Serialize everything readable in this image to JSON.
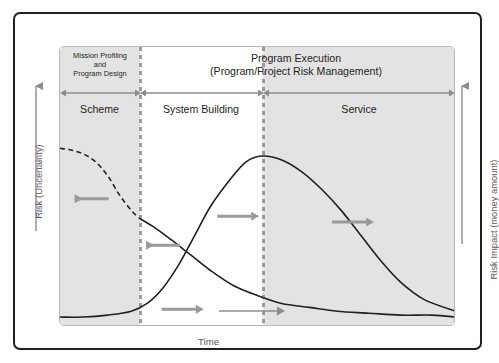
{
  "figure": {
    "title_left": "Mission Profiling\nand\nProgram Design",
    "title_right": "Program Execution\n(Program/Project Risk Management)",
    "axis_left_label": "Risk (Uncertainty)",
    "axis_right_label": "Risk Impact (money amount)",
    "axis_bottom_label": "Time",
    "phases": [
      {
        "label": "Scheme"
      },
      {
        "label": "System Building"
      },
      {
        "label": "Service"
      }
    ],
    "colors": {
      "frame": "#231f20",
      "plot_border": "#b9b9b9",
      "shade": "#e3e3e3",
      "divider": "#9a9a9a",
      "curve": "#231f20",
      "annotation_arrow": "#9a9a9a",
      "axis_arrow": "#8c8c8c",
      "text": "#231f20"
    }
  },
  "chart_data": {
    "type": "line",
    "title": "Program Execution",
    "subtitle": "(Program/Project Risk Management)",
    "xlabel": "Time",
    "ylabel": "Risk (Uncertainty)",
    "y2label": "Risk Impact (money amount)",
    "grid": false,
    "legend": null,
    "xlim": [
      0,
      100
    ],
    "ylim": [
      0,
      100
    ],
    "phase_boundaries": [
      20,
      51
    ],
    "phase_regions": [
      {
        "name": "Scheme",
        "x_start": 0,
        "x_end": 20,
        "shaded": true
      },
      {
        "name": "System Building",
        "x_start": 20,
        "x_end": 51,
        "shaded": false
      },
      {
        "name": "Service",
        "x_start": 51,
        "x_end": 100,
        "shaded": true
      }
    ],
    "series": [
      {
        "name": "Risk (Uncertainty)",
        "style": "dashed-then-solid",
        "dashed_until_x": 20,
        "x": [
          0,
          3,
          6,
          9,
          12,
          15,
          18,
          20,
          24,
          28,
          33,
          38,
          44,
          50,
          56,
          63,
          70,
          78,
          86,
          94,
          100
        ],
        "y": [
          88,
          87,
          85,
          81,
          74,
          64,
          56,
          52,
          47,
          41,
          33,
          25,
          17,
          12,
          8,
          6,
          4,
          3,
          2,
          2,
          1
        ]
      },
      {
        "name": "Risk Impact (money amount)",
        "style": "solid",
        "x": [
          0,
          6,
          12,
          18,
          22,
          26,
          30,
          34,
          38,
          43,
          47,
          51,
          56,
          61,
          66,
          71,
          76,
          81,
          86,
          92,
          100
        ],
        "y": [
          1,
          1,
          2,
          4,
          8,
          16,
          28,
          43,
          58,
          72,
          81,
          84,
          82,
          76,
          67,
          56,
          43,
          30,
          19,
          10,
          4
        ]
      }
    ],
    "annotations": [
      {
        "text": "",
        "icon": "left-arrow",
        "x": 8,
        "y": 62,
        "direction": "left",
        "refers_to": "Risk (Uncertainty)"
      },
      {
        "text": "",
        "icon": "left-arrow",
        "x": 26,
        "y": 38,
        "direction": "left",
        "refers_to": "Risk (Uncertainty)"
      },
      {
        "text": "",
        "icon": "right-arrow",
        "x": 44,
        "y": 53,
        "direction": "right",
        "refers_to": "Risk Impact (money amount)"
      },
      {
        "text": "",
        "icon": "right-arrow",
        "x": 30,
        "y": 5,
        "direction": "right",
        "refers_to": "Risk Impact (money amount)"
      },
      {
        "text": "",
        "icon": "right-arrow",
        "x": 73,
        "y": 50,
        "direction": "right",
        "refers_to": "Risk Impact (money amount)"
      }
    ]
  }
}
